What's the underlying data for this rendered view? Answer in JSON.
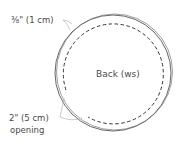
{
  "diagram": {
    "title": "Back (ws)",
    "labels": {
      "seam_allowance": "⅜\" (1 cm)",
      "opening_line1": "2\" (5 cm)",
      "opening_line2": "opening"
    },
    "colors": {
      "outline": "#555555",
      "dashed": "#333333",
      "leader": "#bbbbbb",
      "text": "#4a4a4a"
    }
  }
}
